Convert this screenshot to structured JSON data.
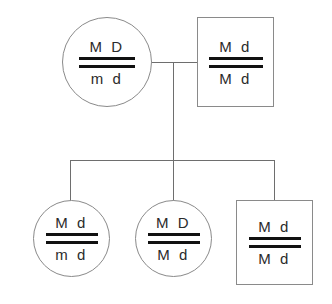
{
  "diagram": {
    "colors": {
      "background": "#ffffff",
      "symbol_outline": "#8a8a8a",
      "connector_line": "#6e6e6e",
      "chromatid_bar": "#111111",
      "allele_text": "#2b2b2b"
    }
  },
  "generation_1": {
    "label": "Parents",
    "mother": {
      "symbol": "circle",
      "sex": "female",
      "top_alleles": "M D",
      "bottom_alleles": "m d"
    },
    "father": {
      "symbol": "square",
      "sex": "male",
      "top_alleles": "M d",
      "bottom_alleles": "M d"
    }
  },
  "generation_2": {
    "label": "Offspring",
    "children": [
      {
        "symbol": "circle",
        "sex": "female",
        "top_alleles": "M d",
        "bottom_alleles": "m d"
      },
      {
        "symbol": "circle",
        "sex": "female",
        "top_alleles": "M D",
        "bottom_alleles": "M d"
      },
      {
        "symbol": "square",
        "sex": "male",
        "top_alleles": "M d",
        "bottom_alleles": "M d"
      }
    ]
  },
  "connectors": {
    "mating_line": "horizontal line joining mother and father",
    "descent_line": "vertical line from mating line to sibship line",
    "sibship_line": "horizontal line spanning the three offspring"
  }
}
